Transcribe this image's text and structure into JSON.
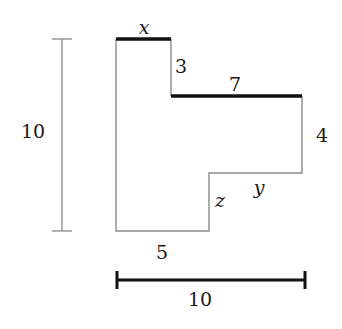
{
  "diagram": {
    "type": "rectilinear-polygon-with-dimensions",
    "shape_vertices_px": [
      [
        116,
        39
      ],
      [
        171,
        39
      ],
      [
        171,
        96
      ],
      [
        302,
        96
      ],
      [
        302,
        173
      ],
      [
        209,
        173
      ],
      [
        209,
        231
      ],
      [
        116,
        231
      ]
    ],
    "thick_edges": [
      "top-edge-x",
      "middle-edge-7"
    ],
    "colors": {
      "thin_line": "#8a8a8a",
      "thick_line": "#111111",
      "text": "#1a1a1a",
      "background": "#ffffff"
    }
  },
  "labels": {
    "top_edge": "x",
    "step_vertical": "3",
    "middle_edge": "7",
    "right_edge": "4",
    "lower_edge": "y",
    "inner_vertical": "z",
    "bottom_edge": "5",
    "height_dimension": "10",
    "width_dimension": "10"
  }
}
